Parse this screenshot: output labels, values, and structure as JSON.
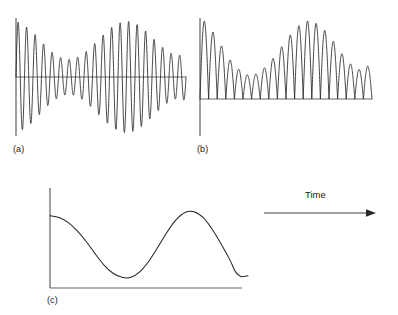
{
  "figure": {
    "title": "",
    "background_color": "#ffffff",
    "line_color": "#262626",
    "panels": [
      {
        "id": "a",
        "label": "(a)",
        "description": "amplitude-modulated oscillating waveform about a zero axis",
        "has_zero_line": true,
        "has_vertical_axis": true
      },
      {
        "id": "b",
        "label": "(b)",
        "description": "rectified waveform, all peaks positive above baseline",
        "has_zero_line": true,
        "has_vertical_axis": true
      },
      {
        "id": "c",
        "label": "(c)",
        "description": "smoothed envelope curve",
        "has_zero_line": true,
        "has_vertical_axis": true
      }
    ],
    "annotation": {
      "label": "Time",
      "arrow_direction": "right",
      "icon": "right-arrow-icon"
    }
  },
  "chart_data": [
    {
      "type": "line",
      "id": "panel-a",
      "title": "(a)",
      "xlabel": "",
      "ylabel": "",
      "grid": false,
      "legend": "none",
      "xlim": [
        0,
        1
      ],
      "ylim": [
        -1,
        1
      ],
      "description": "Beat / amplitude-modulated sinusoid: carrier of about 20 cycles with a slow modulation envelope that is high at the start, dips near one third, rises to a maximum near two thirds, then falls again.",
      "carrier_cycles": 20,
      "envelope_control_points": [
        [
          0.0,
          1.0
        ],
        [
          0.05,
          0.92
        ],
        [
          0.1,
          0.8
        ],
        [
          0.15,
          0.63
        ],
        [
          0.2,
          0.47
        ],
        [
          0.25,
          0.36
        ],
        [
          0.3,
          0.31
        ],
        [
          0.35,
          0.33
        ],
        [
          0.4,
          0.42
        ],
        [
          0.45,
          0.56
        ],
        [
          0.5,
          0.71
        ],
        [
          0.55,
          0.86
        ],
        [
          0.6,
          0.96
        ],
        [
          0.65,
          1.0
        ],
        [
          0.7,
          0.96
        ],
        [
          0.75,
          0.86
        ],
        [
          0.8,
          0.71
        ],
        [
          0.85,
          0.56
        ],
        [
          0.9,
          0.44
        ],
        [
          0.95,
          0.38
        ],
        [
          1.0,
          0.42
        ]
      ]
    },
    {
      "type": "line",
      "id": "panel-b",
      "title": "(b)",
      "xlabel": "",
      "ylabel": "",
      "grid": false,
      "legend": "none",
      "xlim": [
        0,
        1
      ],
      "ylim": [
        0,
        1
      ],
      "description": "Full-wave rectified version of panel (a): the absolute value, producing about 20 positive peaks whose heights follow the same modulation envelope.",
      "rectified": true,
      "peak_count": 20,
      "peak_heights": [
        1.0,
        0.86,
        0.68,
        0.5,
        0.38,
        0.31,
        0.32,
        0.4,
        0.52,
        0.67,
        0.82,
        0.94,
        1.0,
        0.97,
        0.88,
        0.74,
        0.58,
        0.45,
        0.38,
        0.42
      ]
    },
    {
      "type": "line",
      "id": "panel-c",
      "title": "(c)",
      "xlabel": "",
      "ylabel": "",
      "grid": false,
      "legend": "none",
      "xlim": [
        0,
        1
      ],
      "ylim": [
        0,
        1
      ],
      "description": "Low-pass smoothed envelope extracted from panel (b): starts high, falls to a minimum about one third across, rises to a peak about two thirds across, then falls to a shallow minimum near the right end.",
      "values": [
        [
          0.0,
          0.88
        ],
        [
          0.05,
          0.86
        ],
        [
          0.1,
          0.8
        ],
        [
          0.15,
          0.7
        ],
        [
          0.2,
          0.57
        ],
        [
          0.25,
          0.42
        ],
        [
          0.3,
          0.28
        ],
        [
          0.35,
          0.18
        ],
        [
          0.4,
          0.13
        ],
        [
          0.45,
          0.13
        ],
        [
          0.5,
          0.2
        ],
        [
          0.55,
          0.33
        ],
        [
          0.6,
          0.5
        ],
        [
          0.65,
          0.68
        ],
        [
          0.7,
          0.83
        ],
        [
          0.75,
          0.92
        ],
        [
          0.8,
          0.93
        ],
        [
          0.85,
          0.86
        ],
        [
          0.9,
          0.72
        ],
        [
          0.95,
          0.54
        ],
        [
          1.0,
          0.34
        ],
        [
          1.03,
          0.2
        ],
        [
          1.06,
          0.14
        ],
        [
          1.1,
          0.15
        ]
      ]
    }
  ]
}
